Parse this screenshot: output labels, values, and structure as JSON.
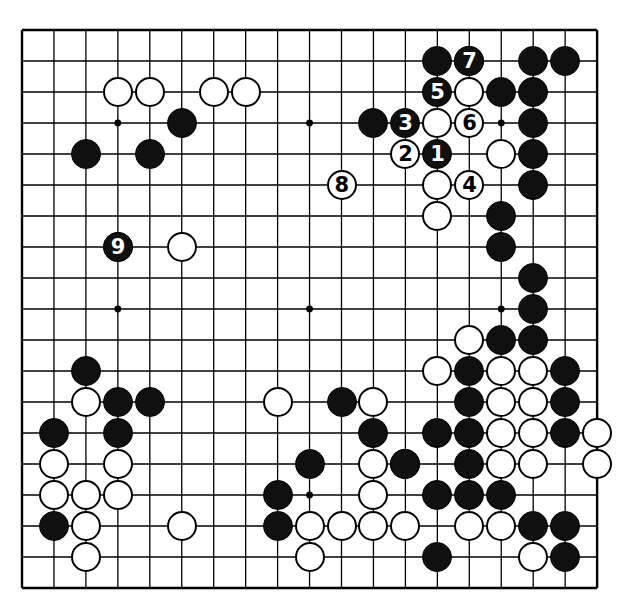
{
  "diagram": {
    "kind": "go-board-diagram",
    "board_size": 19,
    "geometry": {
      "origin_x": 22,
      "origin_y": 30,
      "step_x": 31.95,
      "step_y": 31.0,
      "stone_diameter": 30,
      "line_color": "#000000",
      "board_color": "#ffffff",
      "black_color": "#101010",
      "white_color": "#ffffff"
    },
    "star_points": [
      [
        3,
        3
      ],
      [
        9,
        3
      ],
      [
        15,
        3
      ],
      [
        3,
        9
      ],
      [
        9,
        9
      ],
      [
        15,
        9
      ],
      [
        3,
        15
      ],
      [
        9,
        15
      ],
      [
        15,
        15
      ]
    ],
    "black_stones": [
      [
        13,
        1
      ],
      [
        16,
        1
      ],
      [
        17,
        1
      ],
      [
        15,
        2
      ],
      [
        16,
        2
      ],
      [
        11,
        3
      ],
      [
        16,
        3
      ],
      [
        5,
        3
      ],
      [
        16,
        4
      ],
      [
        2,
        4
      ],
      [
        4,
        4
      ],
      [
        16,
        5
      ],
      [
        15,
        6
      ],
      [
        15,
        7
      ],
      [
        3,
        7
      ],
      [
        16,
        8
      ],
      [
        16,
        9
      ],
      [
        15,
        10
      ],
      [
        16,
        10
      ],
      [
        14,
        11
      ],
      [
        17,
        11
      ],
      [
        14,
        12
      ],
      [
        17,
        12
      ],
      [
        14,
        13
      ],
      [
        14,
        14
      ],
      [
        2,
        11
      ],
      [
        3,
        12
      ],
      [
        4,
        12
      ],
      [
        1,
        13
      ],
      [
        3,
        13
      ],
      [
        10,
        12
      ],
      [
        11,
        13
      ],
      [
        13,
        13
      ],
      [
        9,
        14
      ],
      [
        12,
        14
      ],
      [
        8,
        15
      ],
      [
        17,
        13
      ],
      [
        1,
        16
      ],
      [
        13,
        15
      ],
      [
        14,
        15
      ],
      [
        15,
        15
      ],
      [
        16,
        16
      ],
      [
        17,
        16
      ],
      [
        8,
        16
      ],
      [
        13,
        17
      ],
      [
        17,
        17
      ]
    ],
    "white_stones": [
      [
        14,
        1
      ],
      [
        14,
        2
      ],
      [
        13,
        3
      ],
      [
        3,
        2
      ],
      [
        4,
        2
      ],
      [
        6,
        2
      ],
      [
        7,
        2
      ],
      [
        15,
        4
      ],
      [
        13,
        5
      ],
      [
        5,
        7
      ],
      [
        13,
        6
      ],
      [
        13,
        11
      ],
      [
        14,
        10
      ],
      [
        15,
        11
      ],
      [
        16,
        11
      ],
      [
        15,
        12
      ],
      [
        16,
        12
      ],
      [
        15,
        13
      ],
      [
        16,
        13
      ],
      [
        18,
        13
      ],
      [
        15,
        14
      ],
      [
        16,
        14
      ],
      [
        18,
        14
      ],
      [
        2,
        12
      ],
      [
        1,
        14
      ],
      [
        1,
        15
      ],
      [
        2,
        16
      ],
      [
        3,
        14
      ],
      [
        3,
        15
      ],
      [
        8,
        12
      ],
      [
        11,
        12
      ],
      [
        9,
        16
      ],
      [
        10,
        16
      ],
      [
        11,
        16
      ],
      [
        5,
        16
      ],
      [
        2,
        17
      ],
      [
        9,
        17
      ],
      [
        11,
        14
      ],
      [
        12,
        14
      ],
      [
        12,
        16
      ],
      [
        16,
        17
      ],
      [
        14,
        16
      ],
      [
        15,
        16
      ],
      [
        2,
        15
      ],
      [
        11,
        15
      ]
    ],
    "numbered_moves": [
      {
        "label": "1",
        "color": "black",
        "col": 13,
        "row": 4
      },
      {
        "label": "2",
        "color": "white",
        "col": 12,
        "row": 4
      },
      {
        "label": "3",
        "color": "black",
        "col": 12,
        "row": 3
      },
      {
        "label": "4",
        "color": "white",
        "col": 14,
        "row": 5
      },
      {
        "label": "5",
        "color": "black",
        "col": 13,
        "row": 2
      },
      {
        "label": "6",
        "color": "white",
        "col": 14,
        "row": 3
      },
      {
        "label": "7",
        "color": "black",
        "col": 14,
        "row": 1
      },
      {
        "label": "8",
        "color": "white",
        "col": 10,
        "row": 5
      },
      {
        "label": "9",
        "color": "black",
        "col": 3,
        "row": 7
      }
    ]
  }
}
